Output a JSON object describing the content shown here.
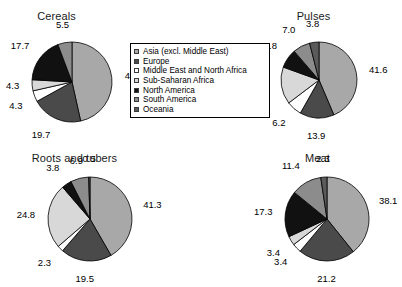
{
  "figure": {
    "background_color": "#ffffff",
    "text_color": "#000000"
  },
  "legend": {
    "name": "region-legend",
    "position": "center-top",
    "border_color": "#000000",
    "entries": [
      {
        "label": "Asia (excl. Middle East)",
        "color": "#a8a8a8"
      },
      {
        "label": "Europe",
        "color": "#4a4a4a"
      },
      {
        "label": "Middle East and North Africa",
        "color": "#ffffff"
      },
      {
        "label": "Sub-Saharan Africa",
        "color": "#d8d8d8"
      },
      {
        "label": "North America",
        "color": "#111111"
      },
      {
        "label": "South America",
        "color": "#8c8c8c"
      },
      {
        "label": "Oceania",
        "color": "#5a5a5a"
      }
    ]
  },
  "chart_data": [
    {
      "type": "pie",
      "title": "Cereals",
      "categories": [
        "Asia (excl. Middle East)",
        "Europe",
        "Middle East and North Africa",
        "Sub-Saharan Africa",
        "North America",
        "South America",
        "Oceania"
      ],
      "values": [
        44.8,
        19.7,
        4.3,
        4.3,
        17.7,
        5.5,
        0.0
      ],
      "labels": [
        "44.8",
        "19.7",
        "4.3",
        "4.3",
        "17.7",
        "5.5",
        ""
      ],
      "colors": [
        "#a8a8a8",
        "#4a4a4a",
        "#ffffff",
        "#d8d8d8",
        "#111111",
        "#8c8c8c",
        "#5a5a5a"
      ],
      "units": "percent"
    },
    {
      "type": "pie",
      "title": "Pulses",
      "categories": [
        "Asia (excl. Middle East)",
        "Europe",
        "Middle East and North Africa",
        "Sub-Saharan Africa",
        "North America",
        "South America",
        "Oceania"
      ],
      "values": [
        41.6,
        13.9,
        6.2,
        15.1,
        7.8,
        7.0,
        3.8
      ],
      "labels": [
        "41.6",
        "13.9",
        "6.2",
        "15.1",
        "7.8",
        "7.0",
        "3.8"
      ],
      "colors": [
        "#a8a8a8",
        "#4a4a4a",
        "#ffffff",
        "#d8d8d8",
        "#111111",
        "#8c8c8c",
        "#5a5a5a"
      ],
      "units": "percent"
    },
    {
      "type": "pie",
      "title": "Roots and tubers",
      "categories": [
        "Asia (excl. Middle East)",
        "Europe",
        "Middle East and North Africa",
        "Sub-Saharan Africa",
        "North America",
        "South America",
        "Oceania"
      ],
      "values": [
        41.3,
        19.5,
        2.3,
        24.8,
        3.8,
        6.9,
        0.5
      ],
      "labels": [
        "41.3",
        "19.5",
        "2.3",
        "24.8",
        "3.8",
        "6.9",
        "0.5"
      ],
      "colors": [
        "#a8a8a8",
        "#4a4a4a",
        "#ffffff",
        "#d8d8d8",
        "#111111",
        "#8c8c8c",
        "#5a5a5a"
      ],
      "units": "percent"
    },
    {
      "type": "pie",
      "title": "Meat",
      "categories": [
        "Asia (excl. Middle East)",
        "Europe",
        "Middle East and North Africa",
        "Sub-Saharan Africa",
        "North America",
        "South America",
        "Oceania"
      ],
      "values": [
        38.1,
        21.2,
        3.4,
        3.4,
        17.3,
        11.4,
        2.3
      ],
      "labels": [
        "38.1",
        "21.2",
        "3.4",
        "3.4",
        "17.3",
        "11.4",
        "2.3"
      ],
      "colors": [
        "#a8a8a8",
        "#4a4a4a",
        "#ffffff",
        "#d8d8d8",
        "#111111",
        "#8c8c8c",
        "#5a5a5a"
      ],
      "units": "percent"
    }
  ]
}
